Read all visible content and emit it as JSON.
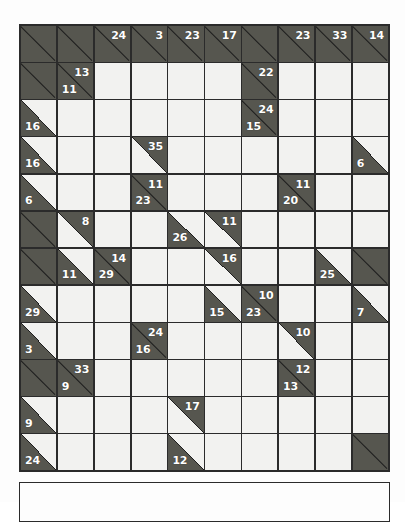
{
  "puzzle": {
    "type": "kakuro",
    "columns": 10,
    "rows": 12,
    "colors": {
      "page_background": "#fdfdfd",
      "block_cell": "#56564f",
      "white_cell": "#f2f2f0",
      "grid_line": "#2b2b2b",
      "clue_text": "#ffffff"
    },
    "grid": [
      [
        {
          "kind": "block"
        },
        {
          "kind": "block"
        },
        {
          "kind": "block",
          "down": "24"
        },
        {
          "kind": "block",
          "down": "3"
        },
        {
          "kind": "block",
          "down": "23"
        },
        {
          "kind": "block",
          "down": "17"
        },
        {
          "kind": "block"
        },
        {
          "kind": "block",
          "down": "23"
        },
        {
          "kind": "block",
          "down": "33"
        },
        {
          "kind": "block",
          "down": "14"
        }
      ],
      [
        {
          "kind": "block"
        },
        {
          "kind": "block",
          "down": "13",
          "right": "11"
        },
        {
          "kind": "white"
        },
        {
          "kind": "white"
        },
        {
          "kind": "white"
        },
        {
          "kind": "white"
        },
        {
          "kind": "block",
          "down": "22"
        },
        {
          "kind": "white"
        },
        {
          "kind": "white"
        },
        {
          "kind": "white"
        }
      ],
      [
        {
          "kind": "half-bl",
          "right": "16"
        },
        {
          "kind": "white"
        },
        {
          "kind": "white"
        },
        {
          "kind": "white"
        },
        {
          "kind": "white"
        },
        {
          "kind": "white"
        },
        {
          "kind": "block",
          "down": "24",
          "right": "15"
        },
        {
          "kind": "white"
        },
        {
          "kind": "white"
        },
        {
          "kind": "white"
        }
      ],
      [
        {
          "kind": "half-bl",
          "right": "16"
        },
        {
          "kind": "white"
        },
        {
          "kind": "white"
        },
        {
          "kind": "half-tr",
          "down": "35"
        },
        {
          "kind": "white"
        },
        {
          "kind": "white"
        },
        {
          "kind": "white"
        },
        {
          "kind": "white"
        },
        {
          "kind": "white"
        },
        {
          "kind": "half-bl",
          "right": "6"
        }
      ],
      [
        {
          "kind": "half-bl",
          "right": "6"
        },
        {
          "kind": "white"
        },
        {
          "kind": "white"
        },
        {
          "kind": "block",
          "down": "11",
          "right": "23"
        },
        {
          "kind": "white"
        },
        {
          "kind": "white"
        },
        {
          "kind": "white"
        },
        {
          "kind": "block",
          "down": "11",
          "right": "20"
        },
        {
          "kind": "white"
        },
        {
          "kind": "white"
        }
      ],
      [
        {
          "kind": "block"
        },
        {
          "kind": "half-tr",
          "down": "8"
        },
        {
          "kind": "white"
        },
        {
          "kind": "white"
        },
        {
          "kind": "half-bl",
          "right": "26"
        },
        {
          "kind": "half-tr",
          "down": "11"
        },
        {
          "kind": "white"
        },
        {
          "kind": "white"
        },
        {
          "kind": "white"
        },
        {
          "kind": "white"
        }
      ],
      [
        {
          "kind": "block"
        },
        {
          "kind": "half-bl",
          "right": "11"
        },
        {
          "kind": "block",
          "down": "14",
          "right": "29"
        },
        {
          "kind": "white"
        },
        {
          "kind": "white"
        },
        {
          "kind": "half-tr",
          "down": "16"
        },
        {
          "kind": "white"
        },
        {
          "kind": "white"
        },
        {
          "kind": "half-bl",
          "right": "25"
        },
        {
          "kind": "block"
        }
      ],
      [
        {
          "kind": "half-bl",
          "right": "29"
        },
        {
          "kind": "white"
        },
        {
          "kind": "white"
        },
        {
          "kind": "white"
        },
        {
          "kind": "white"
        },
        {
          "kind": "half-bl",
          "right": "15"
        },
        {
          "kind": "block",
          "down": "10",
          "right": "23"
        },
        {
          "kind": "white"
        },
        {
          "kind": "white"
        },
        {
          "kind": "half-bl",
          "right": "7"
        }
      ],
      [
        {
          "kind": "half-bl",
          "right": "3"
        },
        {
          "kind": "white"
        },
        {
          "kind": "white"
        },
        {
          "kind": "block",
          "down": "24",
          "right": "16"
        },
        {
          "kind": "white"
        },
        {
          "kind": "white"
        },
        {
          "kind": "white"
        },
        {
          "kind": "half-tr",
          "down": "10"
        },
        {
          "kind": "white"
        },
        {
          "kind": "white"
        }
      ],
      [
        {
          "kind": "block"
        },
        {
          "kind": "block",
          "down": "33",
          "right": "9"
        },
        {
          "kind": "white"
        },
        {
          "kind": "white"
        },
        {
          "kind": "white"
        },
        {
          "kind": "white"
        },
        {
          "kind": "white"
        },
        {
          "kind": "block",
          "down": "12",
          "right": "13"
        },
        {
          "kind": "white"
        },
        {
          "kind": "white"
        }
      ],
      [
        {
          "kind": "half-bl",
          "right": "9"
        },
        {
          "kind": "white"
        },
        {
          "kind": "white"
        },
        {
          "kind": "white"
        },
        {
          "kind": "half-tr",
          "down": "17"
        },
        {
          "kind": "white"
        },
        {
          "kind": "white"
        },
        {
          "kind": "white"
        },
        {
          "kind": "white"
        },
        {
          "kind": "white"
        }
      ],
      [
        {
          "kind": "half-bl",
          "right": "24"
        },
        {
          "kind": "white"
        },
        {
          "kind": "white"
        },
        {
          "kind": "white"
        },
        {
          "kind": "half-bl",
          "right": "12"
        },
        {
          "kind": "white"
        },
        {
          "kind": "white"
        },
        {
          "kind": "white"
        },
        {
          "kind": "white"
        },
        {
          "kind": "block"
        }
      ]
    ]
  },
  "bottom_panel": {
    "text": ""
  }
}
